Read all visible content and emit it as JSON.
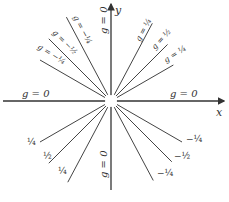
{
  "figure": {
    "axes": {
      "x_label": "x",
      "y_label": "y"
    },
    "isoclines": [
      {
        "id": "pos-x",
        "angle_deg": 0,
        "label": "g = 0"
      },
      {
        "id": "neg-x",
        "angle_deg": 180,
        "label": "g = 0"
      },
      {
        "id": "pos-y",
        "angle_deg": 90,
        "label": "g = 0"
      },
      {
        "id": "neg-y",
        "angle_deg": 270,
        "label": "g = 0"
      },
      {
        "id": "ur-1",
        "angle_deg": 62,
        "label": "g = ¼"
      },
      {
        "id": "ur-2",
        "angle_deg": 45,
        "label": "g = ½"
      },
      {
        "id": "ur-3",
        "angle_deg": 30,
        "label": "g = ¼"
      },
      {
        "id": "ul-1",
        "angle_deg": 118,
        "label": "g = −¼"
      },
      {
        "id": "ul-2",
        "angle_deg": 135,
        "label": "g = −½"
      },
      {
        "id": "ul-3",
        "angle_deg": 150,
        "label": "g = −¼"
      },
      {
        "id": "ll-1",
        "angle_deg": 210,
        "label": "¼"
      },
      {
        "id": "ll-2",
        "angle_deg": 225,
        "label": "½"
      },
      {
        "id": "ll-3",
        "angle_deg": 242,
        "label": "¼"
      },
      {
        "id": "lr-1",
        "angle_deg": 330,
        "label": "−¼"
      },
      {
        "id": "lr-2",
        "angle_deg": 315,
        "label": "−½"
      },
      {
        "id": "lr-3",
        "angle_deg": 298,
        "label": "−¼"
      }
    ]
  }
}
